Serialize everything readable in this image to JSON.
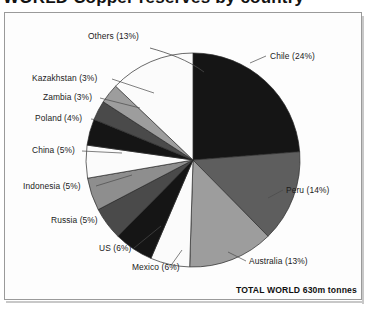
{
  "title": {
    "text": "WORLD Copper reserves by country",
    "cropped": true
  },
  "total_label": "TOTAL WORLD 630m tonnes",
  "chart_data": {
    "type": "pie",
    "title": "WORLD Copper reserves by country",
    "unit": "m tonnes",
    "total": "630m tonnes",
    "start_angle_deg": 0,
    "direction": "clockwise",
    "legend": "none-inline-labels",
    "categories": [
      "Chile",
      "Peru",
      "Australia",
      "Mexico",
      "US",
      "Russia",
      "Indonesia",
      "China",
      "Poland",
      "Zambia",
      "Kazakhstan",
      "Others"
    ],
    "values": [
      24,
      14,
      13,
      6,
      6,
      5,
      5,
      5,
      4,
      3,
      3,
      13
    ],
    "slices": [
      {
        "label": "Chile  (24%)",
        "name": "Chile",
        "value": 24,
        "color": "#151515"
      },
      {
        "label": "Peru (14%)",
        "name": "Peru",
        "value": 14,
        "color": "#5e5e5e"
      },
      {
        "label": "Australia (13%)",
        "name": "Australia",
        "value": 13,
        "color": "#9d9d9d"
      },
      {
        "label": "Mexico (6%)",
        "name": "Mexico",
        "value": 6,
        "color": "#fbfbfb"
      },
      {
        "label": "US (6%)",
        "name": "US",
        "value": 6,
        "color": "#151515"
      },
      {
        "label": "Russia (5%)",
        "name": "Russia",
        "value": 5,
        "color": "#4a4a4a"
      },
      {
        "label": "Indonesia (5%)",
        "name": "Indonesia",
        "value": 5,
        "color": "#8e8e8e"
      },
      {
        "label": "China (5%)",
        "name": "China",
        "value": 5,
        "color": "#fbfbfb"
      },
      {
        "label": "Poland (4%)",
        "name": "Poland",
        "value": 4,
        "color": "#151515"
      },
      {
        "label": "Zambia (3%)",
        "name": "Zambia",
        "value": 3,
        "color": "#4a4a4a"
      },
      {
        "label": "Kazakhstan (3%)",
        "name": "Kazakhstan",
        "value": 3,
        "color": "#9d9d9d"
      },
      {
        "label": "Others (13%)",
        "name": "Others",
        "value": 13,
        "color": "#fbfbfb"
      }
    ]
  },
  "labels": {
    "others": "Others (13%)",
    "kazakhstan": "Kazakhstan (3%)",
    "zambia": "Zambia (3%)",
    "poland": "Poland (4%)",
    "china": "China (5%)",
    "indonesia": "Indonesia (5%)",
    "russia": "Russia (5%)",
    "us": "US (6%)",
    "mexico": "Mexico (6%)",
    "australia": "Australia (13%)",
    "peru": "Peru (14%)",
    "chile": "Chile  (24%)"
  },
  "colors": {
    "black": "#151515",
    "dark_gray": "#4a4a4a",
    "mid_dark_gray": "#5e5e5e",
    "mid_gray": "#8e8e8e",
    "light_gray": "#9d9d9d",
    "white": "#fbfbfb",
    "frame_border": "#9a9a9a",
    "page_bg": "#ffffff"
  }
}
